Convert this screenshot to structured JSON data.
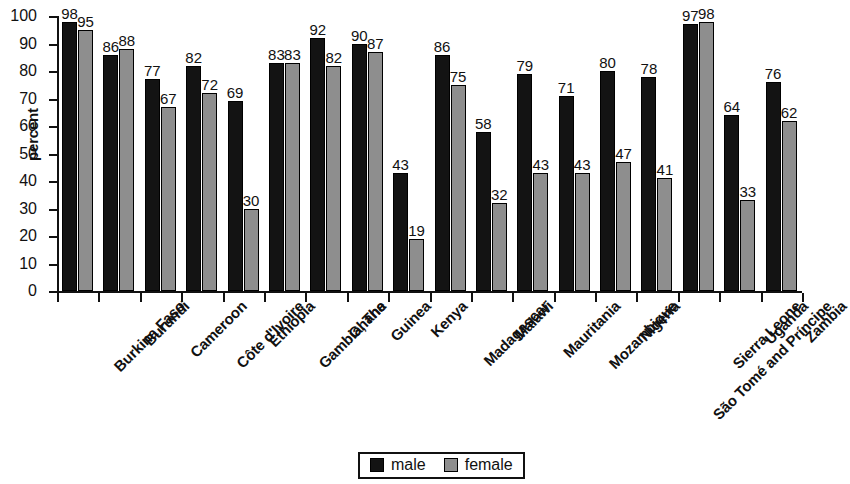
{
  "chart_data": {
    "type": "bar",
    "title": "",
    "xlabel": "",
    "ylabel": "percent",
    "ylim": [
      0,
      100
    ],
    "ytick_step": 10,
    "yticks": [
      0,
      10,
      20,
      30,
      40,
      50,
      60,
      70,
      80,
      90,
      100
    ],
    "grid": false,
    "legend_position": "bottom-center",
    "value_labels": true,
    "colors": {
      "male": "#131313",
      "female": "#8e8e8e",
      "axis": "#111111",
      "background": "#ffffff"
    },
    "categories": [
      "Burkina Faso",
      "Burundi",
      "Cameroon",
      "Côte d'Ivoire",
      "Ethiopia",
      "Gambia, The",
      "Ghana",
      "Guinea",
      "Kenya",
      "Madagascar",
      "Malawi",
      "Mauritania",
      "Mozambique",
      "Nigeria",
      "São Tomé and Príncipe",
      "Sierra Leone",
      "Uganda",
      "Zambia"
    ],
    "series": [
      {
        "name": "male",
        "values": [
          98,
          86,
          77,
          82,
          69,
          83,
          92,
          90,
          43,
          86,
          58,
          79,
          71,
          80,
          78,
          97,
          64,
          76
        ]
      },
      {
        "name": "female",
        "values": [
          95,
          88,
          67,
          72,
          30,
          83,
          82,
          87,
          19,
          75,
          32,
          43,
          43,
          47,
          41,
          98,
          33,
          62
        ]
      }
    ]
  },
  "legend": {
    "items": [
      {
        "label": "male",
        "key": "male"
      },
      {
        "label": "female",
        "key": "female"
      }
    ]
  }
}
